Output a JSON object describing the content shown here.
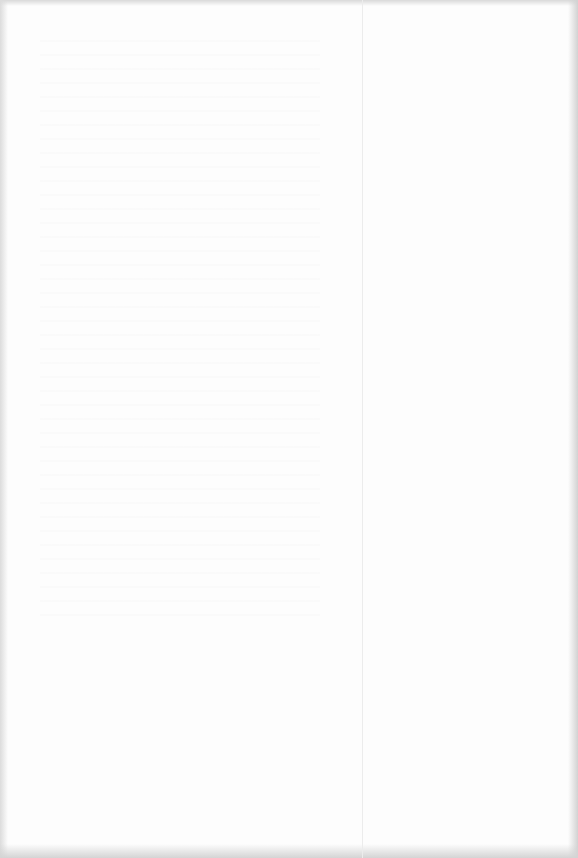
{
  "document": {
    "type": "scanned-page",
    "state": "blank",
    "text": "",
    "colors": {
      "paper": "#fdfdfd",
      "edge_shadow": "#d4d4d4",
      "fold_line": "#ececec"
    }
  }
}
